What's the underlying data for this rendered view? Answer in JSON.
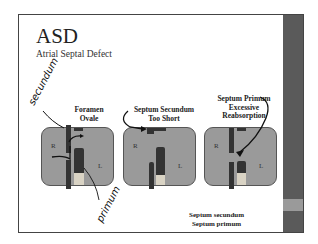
{
  "slide": {
    "title": "ASD",
    "subtitle": "Atrial Septal Defect",
    "accent_strip_color": "#5a5a5a",
    "strip_highlight_color": "#9a9a9a"
  },
  "diagrams": [
    {
      "label_line1": "Foramen",
      "label_line2": "Ovale",
      "left_chamber": "R",
      "right_chamber": "L"
    },
    {
      "label_line1": "Septum Secundum",
      "label_line2": "Too Short",
      "left_chamber": "R",
      "right_chamber": "L"
    },
    {
      "label_line1": "Septum Primum",
      "label_line2": "Excessive",
      "label_line3": "Reabsorption",
      "left_chamber": "R",
      "right_chamber": "L"
    }
  ],
  "handwritten": {
    "top_annotation": "secundum",
    "bottom_annotation": "primum"
  },
  "legend": {
    "line1": "Septum secundum",
    "line2": "Septum primum"
  }
}
